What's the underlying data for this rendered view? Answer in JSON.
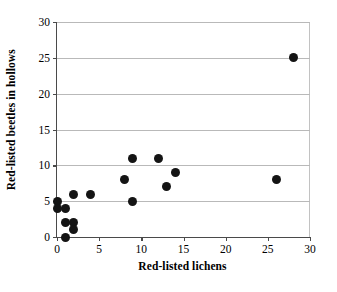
{
  "chart_data": {
    "type": "scatter",
    "title": "",
    "xlabel": "Red-listed lichens",
    "ylabel": "Red-listed beetles in hollows",
    "xlim": [
      0,
      30
    ],
    "ylim": [
      0,
      30
    ],
    "xticks": [
      0,
      5,
      10,
      15,
      20,
      25,
      30
    ],
    "yticks": [
      0,
      5,
      10,
      15,
      20,
      25,
      30
    ],
    "xtick_labels": [
      "0",
      "5",
      "10",
      "15",
      "20",
      "25",
      "30"
    ],
    "ytick_labels": [
      "0",
      "5",
      "10",
      "15",
      "20",
      "25",
      "30"
    ],
    "grid": "horizontal",
    "legend": null,
    "marker": "filled-circle",
    "marker_color": "#141414",
    "points": [
      {
        "x": 0,
        "y": 5
      },
      {
        "x": 0,
        "y": 4
      },
      {
        "x": 1,
        "y": 4
      },
      {
        "x": 1,
        "y": 2
      },
      {
        "x": 1,
        "y": 0
      },
      {
        "x": 2,
        "y": 6
      },
      {
        "x": 2,
        "y": 2
      },
      {
        "x": 2,
        "y": 1
      },
      {
        "x": 4,
        "y": 6
      },
      {
        "x": 8,
        "y": 8
      },
      {
        "x": 9,
        "y": 11
      },
      {
        "x": 9,
        "y": 5
      },
      {
        "x": 12,
        "y": 11
      },
      {
        "x": 13,
        "y": 7
      },
      {
        "x": 14,
        "y": 9
      },
      {
        "x": 26,
        "y": 8
      },
      {
        "x": 28,
        "y": 25
      }
    ]
  }
}
